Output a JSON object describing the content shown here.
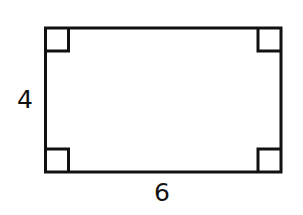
{
  "diagram": {
    "shape": "rectangle",
    "stroke_color": "#111111",
    "background": "#ffffff",
    "right_angle_markers": 4,
    "labels": {
      "height": "4",
      "width": "6"
    }
  }
}
